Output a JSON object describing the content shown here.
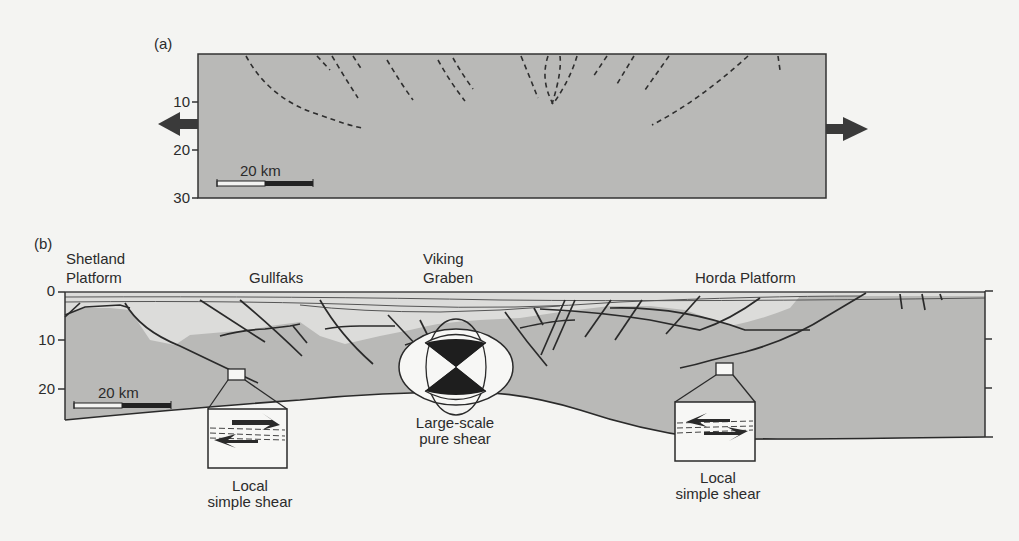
{
  "figure": {
    "panel_a": {
      "label": "(a)",
      "depth_ticks": [
        "10",
        "20",
        "30"
      ],
      "scale_bar": "20 km",
      "arrows": [
        "extension-left",
        "extension-right"
      ]
    },
    "panel_b": {
      "label": "(b)",
      "places": {
        "shetland_line1": "Shetland",
        "shetland_line2": "Platform",
        "gullfaks": "Gullfaks",
        "viking_line1": "Viking",
        "viking_line2": "Graben",
        "horda": "Horda Platform"
      },
      "depth_ticks": [
        "0",
        "10",
        "20"
      ],
      "scale_bar": "20 km",
      "captions": {
        "left_line1": "Local",
        "left_line2": "simple shear",
        "center_line1": "Large-scale",
        "center_line2": "pure shear",
        "right_line1": "Local",
        "right_line2": "simple shear"
      }
    },
    "colors": {
      "background": "#f4f4f2",
      "crust_gray": "#b9b9b7",
      "basin_light": "#dcdcda",
      "line": "#2a2a2a",
      "white": "#f7f7f5",
      "black": "#1e1e1e"
    }
  }
}
